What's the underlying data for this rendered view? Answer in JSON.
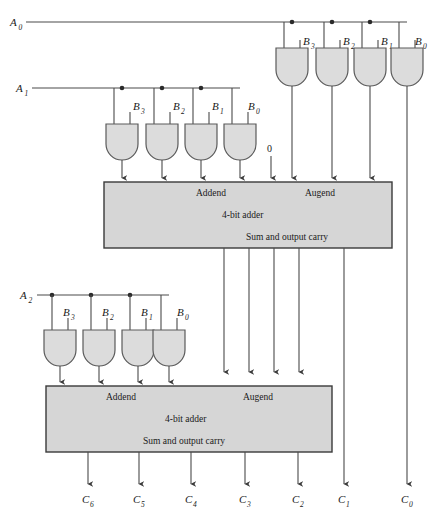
{
  "inputs": {
    "a_labels": [
      {
        "name": "A0",
        "base": "A",
        "sub": "0"
      },
      {
        "name": "A1",
        "base": "A",
        "sub": "1"
      },
      {
        "name": "A2",
        "base": "A",
        "sub": "2"
      }
    ],
    "b_labels": [
      {
        "base": "B",
        "sub": "3"
      },
      {
        "base": "B",
        "sub": "2"
      },
      {
        "base": "B",
        "sub": "1"
      },
      {
        "base": "B",
        "sub": "0"
      }
    ],
    "carry_in_label": "0"
  },
  "adders": [
    {
      "id": "adder-1",
      "addend_label": "Addend",
      "augend_label": "Augend",
      "title": "4-bit adder",
      "output_label": "Sum and output carry"
    },
    {
      "id": "adder-2",
      "addend_label": "Addend",
      "augend_label": "Augend",
      "title": "4-bit adder",
      "output_label": "Sum and output carry"
    }
  ],
  "outputs": [
    {
      "base": "C",
      "sub": "6"
    },
    {
      "base": "C",
      "sub": "5"
    },
    {
      "base": "C",
      "sub": "4"
    },
    {
      "base": "C",
      "sub": "3"
    },
    {
      "base": "C",
      "sub": "2"
    },
    {
      "base": "C",
      "sub": "1"
    },
    {
      "base": "C",
      "sub": "0"
    }
  ],
  "gate_rows": [
    {
      "row": "top",
      "gate_count": 4,
      "gate_type": "AND"
    },
    {
      "row": "middle",
      "gate_count": 4,
      "gate_type": "AND"
    },
    {
      "row": "bottom",
      "gate_count": 4,
      "gate_type": "AND"
    }
  ],
  "colors": {
    "gate_fill": "#dcdcdc",
    "adder_fill": "#d6d6d6",
    "wire": "#4a4a4a",
    "outline": "#5a5a5a",
    "text": "#1a1a1a",
    "background": "#ffffff"
  }
}
